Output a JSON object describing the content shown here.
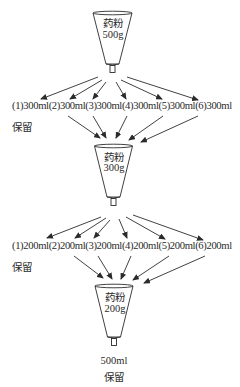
{
  "diagram": {
    "type": "flow",
    "stage1": {
      "funnel": {
        "line1": "药粉",
        "line2": "500g"
      },
      "fractions": "(1)300ml(2)300ml(3)300ml(4)300ml(5)300ml(6)300ml",
      "fraction_items": [
        "(1)300ml",
        "(2)300ml",
        "(3)300ml",
        "(4)300ml",
        "(5)300ml",
        "(6)300ml"
      ],
      "keep_label": "保留"
    },
    "stage2": {
      "funnel": {
        "line1": "药粉",
        "line2": "300g"
      },
      "fractions": "(1)200ml(2)200ml(3)200ml(4)200ml(5)200ml(6)200ml",
      "fraction_items": [
        "(1)200ml",
        "(2)200ml",
        "(3)200ml",
        "(4)200ml",
        "(5)200ml",
        "(6)200ml"
      ],
      "keep_label": "保留"
    },
    "stage3": {
      "funnel": {
        "line1": "药粉",
        "line2": "200g"
      },
      "output_volume": "500ml",
      "keep_label": "保留"
    },
    "colors": {
      "line": "#2b2b2b",
      "text": "#2a2a2a",
      "background": "#ffffff"
    }
  }
}
